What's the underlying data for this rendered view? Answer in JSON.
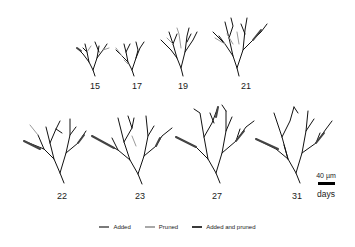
{
  "figure": {
    "days": [
      "15",
      "17",
      "19",
      "21",
      "22",
      "23",
      "27",
      "31"
    ],
    "scale_bar": {
      "label": "40 µm",
      "axis_label": "days"
    },
    "legend": [
      {
        "label": "Added",
        "color": "#7a7a7a"
      },
      {
        "label": "Pruned",
        "color": "#a8a8a8"
      },
      {
        "label": "Added and pruned",
        "color": "#3a3a3a"
      }
    ]
  }
}
